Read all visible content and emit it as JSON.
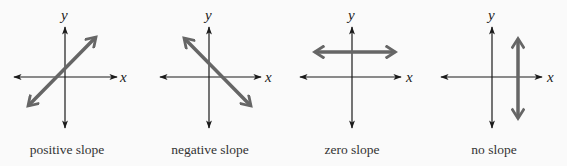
{
  "figure": {
    "background": "#fafafa",
    "axis_color": "#1a1a1a",
    "line_color": "#666666",
    "panels": [
      {
        "caption": "positive slope",
        "x_label": "x",
        "y_label": "y",
        "origin": [
          65,
          77
        ],
        "line": [
          [
            29,
            105
          ],
          [
            95,
            38
          ]
        ]
      },
      {
        "caption": "negative slope",
        "x_label": "x",
        "y_label": "y",
        "origin": [
          209,
          77
        ],
        "line": [
          [
            184,
            38
          ],
          [
            250,
            106
          ]
        ]
      },
      {
        "caption": "zero slope",
        "x_label": "x",
        "y_label": "y",
        "origin": [
          352,
          77
        ],
        "line": [
          [
            314,
            52
          ],
          [
            394,
            52
          ]
        ]
      },
      {
        "caption": "no slope",
        "x_label": "x",
        "y_label": "y",
        "origin": [
          492,
          77
        ],
        "line": [
          [
            518,
            38
          ],
          [
            518,
            118
          ]
        ]
      }
    ]
  }
}
